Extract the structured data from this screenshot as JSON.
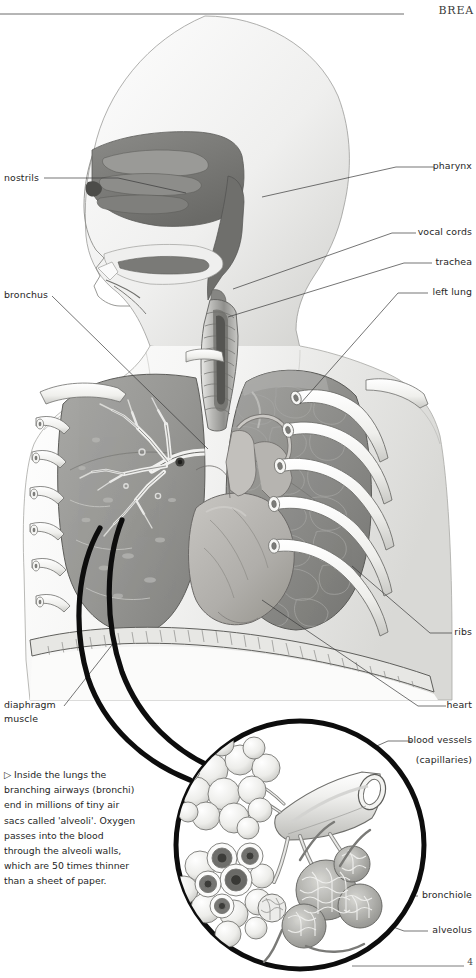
{
  "header": {
    "running_title": "BREA",
    "page_number": "4"
  },
  "figure": {
    "caption": "▷ Inside the lungs the branching airways (bronchi) end in millions of tiny air sacs called 'alveoli'. Oxygen passes into the blood through the alveoli walls, which are 50 times thinner than a sheet of paper."
  },
  "labels_left": [
    {
      "id": "nostrils",
      "text": "nostrils",
      "x": 4,
      "y": 172,
      "leader": [
        [
          44,
          178
        ],
        [
          118,
          178
        ],
        [
          186,
          193
        ]
      ]
    },
    {
      "id": "bronchus",
      "text": "bronchus",
      "x": 4,
      "y": 289,
      "leader": [
        [
          52,
          296
        ],
        [
          208,
          449
        ]
      ]
    },
    {
      "id": "diaphragm",
      "text": "diaphragm",
      "x": 4,
      "y": 699,
      "leader": [
        [
          64,
          706
        ],
        [
          112,
          645
        ]
      ]
    },
    {
      "id": "muscle",
      "text": "muscle",
      "x": 4,
      "y": 713,
      "leader": []
    }
  ],
  "labels_right": [
    {
      "id": "pharynx",
      "text": "pharynx",
      "x": 472,
      "y": 160,
      "leader": [
        [
          434,
          167
        ],
        [
          396,
          167
        ],
        [
          262,
          197
        ]
      ]
    },
    {
      "id": "vocal-cords",
      "text": "vocal cords",
      "x": 472,
      "y": 226,
      "leader": [
        [
          416,
          233
        ],
        [
          392,
          233
        ],
        [
          233,
          289
        ]
      ]
    },
    {
      "id": "trachea",
      "text": "trachea",
      "x": 472,
      "y": 256,
      "leader": [
        [
          432,
          263
        ],
        [
          404,
          263
        ],
        [
          228,
          317
        ]
      ]
    },
    {
      "id": "left-lung",
      "text": "left lung",
      "x": 472,
      "y": 286,
      "leader": [
        [
          428,
          293
        ],
        [
          398,
          293
        ],
        [
          300,
          404
        ]
      ]
    },
    {
      "id": "ribs",
      "text": "ribs",
      "x": 472,
      "y": 626,
      "leader": [
        [
          452,
          633
        ],
        [
          430,
          633
        ],
        [
          352,
          566
        ]
      ]
    },
    {
      "id": "heart",
      "text": "heart",
      "x": 472,
      "y": 699,
      "leader": [
        [
          446,
          706
        ],
        [
          418,
          706
        ],
        [
          262,
          600
        ]
      ]
    },
    {
      "id": "blood-vessels",
      "text": "blood vessels",
      "x": 472,
      "y": 734,
      "leader": [
        [
          412,
          741
        ],
        [
          388,
          741
        ],
        [
          336,
          764
        ]
      ]
    },
    {
      "id": "capillaries",
      "text": "(capillaries)",
      "x": 472,
      "y": 754,
      "leader": []
    },
    {
      "id": "bronchiole",
      "text": "bronchiole",
      "x": 472,
      "y": 889,
      "leader": [
        [
          418,
          896
        ],
        [
          400,
          896
        ],
        [
          330,
          828
        ]
      ]
    },
    {
      "id": "alveolus",
      "text": "alveolus",
      "x": 472,
      "y": 924,
      "leader": [
        [
          428,
          931
        ],
        [
          404,
          931
        ],
        [
          300,
          893
        ]
      ]
    }
  ],
  "colors": {
    "ink": "#262626",
    "rule": "#6d6d6d",
    "skin_light": "#f3f3f2",
    "skin_shade": "#dcdcda",
    "lung_right": "#9a9a97",
    "lung_left": "#8e8e8b",
    "nasal_cavity": "#7d7d7a",
    "heart": "#b4b2ae",
    "rib_white": "#f7f7f5",
    "callout_stroke": "#0d0d0d",
    "alveoli_fill": "#ededeb",
    "capillary": "#808080"
  }
}
